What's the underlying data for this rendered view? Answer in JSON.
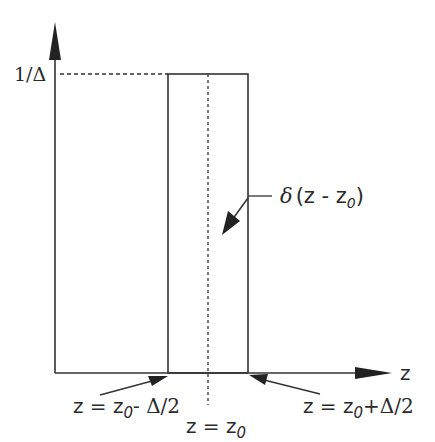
{
  "diagram": {
    "y_axis": {
      "tick_label": "1/Δ"
    },
    "x_axis": {
      "label": "z"
    },
    "pulse_label": {
      "prefix": "δ",
      "text": "(z - z",
      "sub": "0",
      "suffix": ")"
    },
    "annotations": {
      "left_edge": {
        "prefix": "z = z",
        "sub": "0",
        "suffix": "- Δ/2"
      },
      "center": {
        "prefix": "z = z",
        "sub": "0"
      },
      "right_edge": {
        "prefix": "z = z",
        "sub": "0",
        "suffix": "+Δ/2"
      }
    },
    "colors": {
      "stroke": "#333333",
      "background": "#ffffff"
    }
  }
}
